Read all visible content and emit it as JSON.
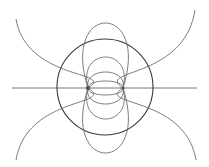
{
  "diagram": {
    "type": "dipole-field-lines",
    "width": 209,
    "height": 167,
    "colors": {
      "background": "#ffffff",
      "field_line": "#6e6e6e",
      "circle": "#3a3a3a",
      "charge": "#555555"
    },
    "charges": [
      {
        "name": "left-charge",
        "x": 88,
        "y": 88
      },
      {
        "name": "right-charge",
        "x": 123,
        "y": 88
      }
    ],
    "circle": {
      "cx": 105,
      "cy": 87,
      "r": 48
    },
    "axis": {
      "y": 88,
      "x_start": 12,
      "x_end": 197
    },
    "loops": [
      {
        "top": 81,
        "bottom": 95,
        "x_min": 87,
        "x_max": 124
      },
      {
        "top": 72,
        "bottom": 104,
        "x_min": 83,
        "x_max": 127
      },
      {
        "top": 57,
        "bottom": 119,
        "x_min": 78,
        "x_max": 133
      },
      {
        "top": 23,
        "bottom": 153,
        "x_min": 62,
        "x_max": 148
      }
    ],
    "outer_arcs": [
      {
        "from": "left-charge",
        "to": [
          16,
          19
        ]
      },
      {
        "from": "left-charge",
        "to": [
          16,
          160
        ]
      },
      {
        "from": "right-charge",
        "to": [
          195,
          10
        ]
      },
      {
        "from": "right-charge",
        "to": [
          196,
          160
        ]
      }
    ]
  }
}
